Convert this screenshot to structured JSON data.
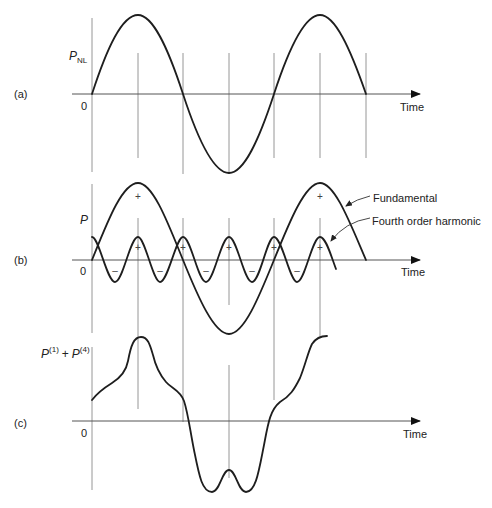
{
  "figure": {
    "panels": [
      {
        "id": "a",
        "panel_label": "(a)",
        "y_label": "P",
        "y_label_sub": "NL",
        "origin_label": "0",
        "x_label": "Time"
      },
      {
        "id": "b",
        "panel_label": "(b)",
        "y_label": "P",
        "origin_label": "0",
        "x_label": "Time",
        "annotations": {
          "fundamental": "Fundamental",
          "harmonic": "Fourth order harmonic"
        },
        "signs": {
          "plus": "+",
          "minus": "–"
        }
      },
      {
        "id": "c",
        "panel_label": "(c)",
        "y_label_p1": "P",
        "y_label_p1_sup": "(1)",
        "y_label_plus": "+",
        "y_label_p4": "P",
        "y_label_p4_sup": "(4)",
        "origin_label": "0",
        "x_label": "Time"
      }
    ]
  }
}
